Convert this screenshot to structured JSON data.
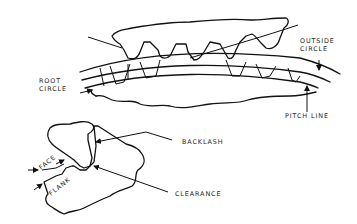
{
  "diagram": {
    "labels": {
      "outside_circle": "OUTSIDE\nCIRCLE",
      "root_circle": "ROOT\nCIRCLE",
      "pitch_line": "PITCH LINE",
      "backlash": "BACKLASH",
      "clearance": "CLEARANCE",
      "face": "FACE",
      "flank": "FLANK"
    },
    "colors": {
      "line": "#111111",
      "text": "#222222",
      "background": "#ffffff"
    }
  }
}
